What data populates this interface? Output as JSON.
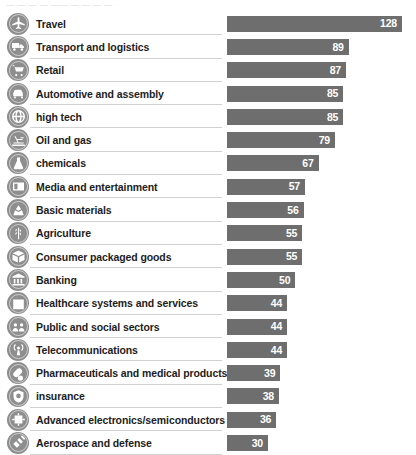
{
  "header": {
    "clipped_text": "—  —  —  —   ——  —  —  —  —"
  },
  "axis": {
    "bar_left_px": 227,
    "px_per_unit": 1.367,
    "max_value": 128
  },
  "colors": {
    "bar": "#6e6e6e",
    "icon_badge": "#8e8e8e",
    "value_text": "#ffffff",
    "label_text": "#1d1d1d",
    "rule": "#d2d2d2",
    "background": "#ffffff"
  },
  "chart_data": {
    "type": "bar",
    "title": "",
    "xlabel": "",
    "ylabel": "",
    "orientation": "horizontal",
    "grid": false,
    "legend": "none",
    "xlim": [
      0,
      128
    ],
    "categories": [
      "Travel",
      "Transport and logistics",
      "Retail",
      "Automotive and assembly",
      "high tech",
      "Oil and gas",
      "chemicals",
      "Media and entertainment",
      "Basic materials",
      "Agriculture",
      "Consumer packaged goods",
      "Banking",
      "Healthcare systems and services",
      "Public and social sectors",
      "Telecommunications",
      "Pharmaceuticals and medical products",
      "insurance",
      "Advanced electronics/semiconductors",
      "Aerospace and defense"
    ],
    "values": [
      128,
      89,
      87,
      85,
      85,
      79,
      67,
      57,
      56,
      55,
      55,
      50,
      44,
      44,
      44,
      39,
      38,
      36,
      30
    ]
  },
  "rows": [
    {
      "label": "Travel",
      "value": 128,
      "icon": "airplane-icon"
    },
    {
      "label": "Transport and logistics",
      "value": 89,
      "icon": "truck-icon"
    },
    {
      "label": "Retail",
      "value": 87,
      "icon": "shopping-cart-icon"
    },
    {
      "label": "Automotive and assembly",
      "value": 85,
      "icon": "car-icon"
    },
    {
      "label": "high tech",
      "value": 85,
      "icon": "globe-icon"
    },
    {
      "label": "Oil and gas",
      "value": 79,
      "icon": "oil-rig-icon"
    },
    {
      "label": "chemicals",
      "value": 67,
      "icon": "flask-icon"
    },
    {
      "label": "Media and entertainment",
      "value": 57,
      "icon": "media-icon"
    },
    {
      "label": "Basic materials",
      "value": 56,
      "icon": "minerals-icon"
    },
    {
      "label": "Agriculture",
      "value": 55,
      "icon": "wheat-icon"
    },
    {
      "label": "Consumer packaged goods",
      "value": 55,
      "icon": "package-icon"
    },
    {
      "label": "Banking",
      "value": 50,
      "icon": "bank-icon"
    },
    {
      "label": "Healthcare systems and services",
      "value": 44,
      "icon": "hospital-icon"
    },
    {
      "label": "Public and social sectors",
      "value": 44,
      "icon": "people-icon"
    },
    {
      "label": "Telecommunications",
      "value": 44,
      "icon": "antenna-icon"
    },
    {
      "label": "Pharmaceuticals and medical products",
      "value": 39,
      "icon": "pill-icon"
    },
    {
      "label": "insurance",
      "value": 38,
      "icon": "shield-icon"
    },
    {
      "label": "Advanced electronics/semiconductors",
      "value": 36,
      "icon": "chip-icon"
    },
    {
      "label": "Aerospace and defense",
      "value": 30,
      "icon": "satellite-icon"
    }
  ]
}
